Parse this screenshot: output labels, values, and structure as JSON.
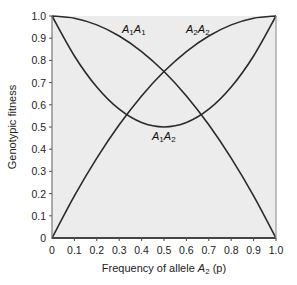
{
  "chart_data": {
    "type": "line",
    "title": "",
    "xlabel": "Frequency of allele A2 (p)",
    "ylabel": "Genotypic fitness",
    "xlim": [
      0,
      1.0
    ],
    "ylim": [
      0,
      1.0
    ],
    "xticks": [
      "0",
      "0.1",
      "0.2",
      "0.3",
      "0.4",
      "0.5",
      "0.6",
      "0.7",
      "0.8",
      "0.9",
      "1.0"
    ],
    "yticks": [
      "0",
      "0.1",
      "0.2",
      "0.3",
      "0.4",
      "0.5",
      "0.6",
      "0.7",
      "0.8",
      "0.9",
      "1.0"
    ],
    "grid": false,
    "x": [
      0,
      0.1,
      0.2,
      0.3,
      0.4,
      0.5,
      0.6,
      0.7,
      0.8,
      0.9,
      1.0
    ],
    "series": [
      {
        "name": "A1A1",
        "values": [
          1.0,
          0.99,
          0.96,
          0.91,
          0.84,
          0.75,
          0.64,
          0.51,
          0.36,
          0.19,
          0.0
        ]
      },
      {
        "name": "A2A2",
        "values": [
          0.0,
          0.19,
          0.36,
          0.51,
          0.64,
          0.75,
          0.84,
          0.91,
          0.96,
          0.99,
          1.0
        ]
      },
      {
        "name": "A1A2",
        "values": [
          1.0,
          0.82,
          0.68,
          0.58,
          0.52,
          0.5,
          0.52,
          0.58,
          0.68,
          0.82,
          1.0
        ]
      }
    ],
    "annotations": [
      {
        "text": "A1A1",
        "near_x": 0.32,
        "near_y": 0.94
      },
      {
        "text": "A2A2",
        "near_x": 0.65,
        "near_y": 0.94
      },
      {
        "text": "A1A2",
        "near_x": 0.5,
        "near_y": 0.44
      }
    ],
    "colors": {
      "background": "#ececec",
      "line": "#2a2a2a",
      "axis": "#555555"
    }
  },
  "labels": {
    "x_axis_prefix": "Frequency of allele ",
    "x_axis_var": "A",
    "x_axis_sub": "2",
    "x_axis_suffix": " (p)",
    "y_axis": "Genotypic fitness"
  }
}
